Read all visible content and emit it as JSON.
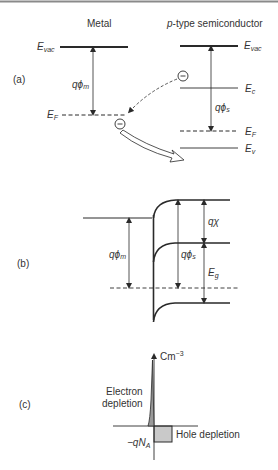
{
  "figure": {
    "top_border_color": "#8a8a8a",
    "line_color": "#2a2a2a",
    "panel_a": {
      "label": "(a)",
      "metal_title": "Metal",
      "semi_title_prefix": "p",
      "semi_title_rest": "-type semiconductor",
      "metal": {
        "evac_label": "E",
        "evac_sub": "vac",
        "ef_label": "E",
        "ef_sub": "F",
        "work_function_label": "qϕ",
        "work_function_sub": "m"
      },
      "semiconductor": {
        "evac_label": "E",
        "evac_sub": "vac",
        "ec_label": "E",
        "ec_sub": "c",
        "ef_label": "E",
        "ef_sub": "F",
        "ev_label": "E",
        "ev_sub": "v",
        "work_function_label": "qϕ",
        "work_function_sub": "s"
      },
      "electron_symbol": "−"
    },
    "panel_b": {
      "label": "(b)",
      "phi_m_label": "qϕ",
      "phi_m_sub": "m",
      "phi_s_label": "qϕ",
      "phi_s_sub": "s",
      "chi_label": "qχ",
      "eg_label": "E",
      "eg_sub": "g"
    },
    "panel_c": {
      "label": "(c)",
      "axis_unit": "Cm",
      "axis_unit_sup": "−3",
      "electron_depletion_line1": "Electron",
      "electron_depletion_line2": "depletion",
      "hole_depletion": "Hole depletion",
      "charge_label_prefix": "−q",
      "charge_label_N": "N",
      "charge_label_sub": "A",
      "box_fill": "#c9c9c9"
    }
  }
}
